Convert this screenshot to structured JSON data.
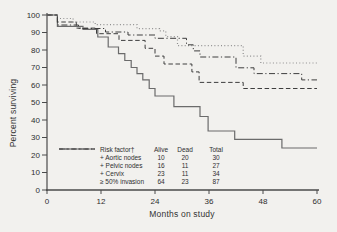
{
  "figure": {
    "background": "#f2f1ee",
    "text_color": "#2e2e2e",
    "axis_color": "#4a4a4a"
  },
  "chart_data": {
    "type": "line",
    "subtype": "kaplan-meier-step",
    "title": "",
    "xlabel": "Months on study",
    "ylabel": "Percent surviving",
    "xlim": [
      0,
      60
    ],
    "ylim": [
      0,
      100
    ],
    "x_ticks": [
      0,
      12,
      24,
      36,
      48,
      60
    ],
    "y_ticks": [
      0,
      10,
      20,
      30,
      40,
      50,
      60,
      70,
      80,
      90,
      100
    ],
    "grid": false,
    "legend_position": "inside-bottom-left-table",
    "series": [
      {
        "name": "+ Aortic nodes",
        "line_style": "solid",
        "points": [
          [
            0,
            100
          ],
          [
            2.3,
            93.5
          ],
          [
            8,
            91.8
          ],
          [
            11.3,
            87.4
          ],
          [
            13.6,
            81.7
          ],
          [
            15.9,
            77.9
          ],
          [
            17.3,
            74
          ],
          [
            18.7,
            70
          ],
          [
            20,
            66.5
          ],
          [
            21.3,
            62.9
          ],
          [
            22.7,
            58
          ],
          [
            24,
            53.7
          ],
          [
            28.2,
            47.6
          ],
          [
            34,
            42
          ],
          [
            35.8,
            33.7
          ],
          [
            41.7,
            29
          ],
          [
            52.2,
            24
          ],
          [
            60,
            24
          ]
        ]
      },
      {
        "name": "+ Pelvic nodes",
        "line_style": "dashed",
        "points": [
          [
            0,
            100
          ],
          [
            2.3,
            96
          ],
          [
            6.5,
            92.5
          ],
          [
            11,
            89.3
          ],
          [
            16,
            85.5
          ],
          [
            21.8,
            81
          ],
          [
            24,
            76.5
          ],
          [
            26,
            72
          ],
          [
            32.2,
            67.5
          ],
          [
            33.8,
            61.5
          ],
          [
            43.6,
            58
          ],
          [
            60,
            58
          ]
        ]
      },
      {
        "name": "+ Cervix",
        "line_style": "dotted",
        "points": [
          [
            0,
            100
          ],
          [
            2.3,
            98
          ],
          [
            5.8,
            96
          ],
          [
            10.7,
            94.5
          ],
          [
            20,
            92.2
          ],
          [
            25,
            90.9
          ],
          [
            26.4,
            87.6
          ],
          [
            29,
            82.5
          ],
          [
            43.6,
            76.5
          ],
          [
            47.5,
            72.6
          ],
          [
            60,
            72.6
          ]
        ]
      },
      {
        "name": "≥ 50% invasion",
        "line_style": "dashdot",
        "points": [
          [
            0,
            100
          ],
          [
            2.3,
            94.3
          ],
          [
            7,
            92.3
          ],
          [
            13,
            90.3
          ],
          [
            18,
            88.6
          ],
          [
            24,
            86.7
          ],
          [
            31,
            83
          ],
          [
            32.5,
            79.5
          ],
          [
            34,
            76
          ],
          [
            42,
            69.8
          ],
          [
            46,
            66.5
          ],
          [
            56.6,
            62.9
          ],
          [
            60,
            62.9
          ]
        ]
      }
    ]
  },
  "legend_table": {
    "risk_factor_header": "Risk factor†",
    "columns": {
      "alive": "Alive",
      "dead": "Dead",
      "total": "Total"
    },
    "rows": [
      {
        "label": "+ Aortic nodes",
        "style": "solid",
        "alive": "10",
        "dead": "20",
        "total": "30"
      },
      {
        "label": "+ Pelvic nodes",
        "style": "dashed",
        "alive": "16",
        "dead": "11",
        "total": "27"
      },
      {
        "label": "+ Cervix",
        "style": "dotted",
        "alive": "23",
        "dead": "11",
        "total": "34"
      },
      {
        "label": "≥ 50% invasion",
        "style": "dashdot",
        "alive": "64",
        "dead": "23",
        "total": "87"
      }
    ]
  }
}
